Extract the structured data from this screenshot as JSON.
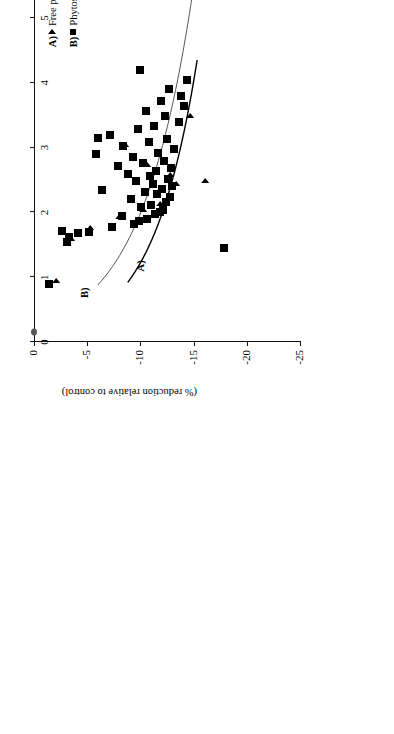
{
  "chart_data": {
    "type": "scatter",
    "title": "",
    "xlabel": "(g sterol equivalents/d)",
    "ylabel": "(% reduction relative to control)",
    "xlim": [
      0,
      10
    ],
    "ylim": [
      -25,
      0
    ],
    "xticks": [
      "0",
      "1",
      "2",
      "3",
      "4",
      "5",
      "6",
      "7",
      "8",
      "9",
      "10"
    ],
    "yticks": [
      "0",
      "-5",
      "-10",
      "-15",
      "-20",
      "-25"
    ],
    "grid": false,
    "legend_position": "upper-right",
    "orientation_note": "page-rotated-90",
    "series": [
      {
        "name": "Free phytosterols/stanols",
        "key": "A)",
        "marker": "triangle",
        "color": "#000000",
        "fit_label": "y = -4.2001Ln(x) - 9.1568",
        "fit_coef": -4.2001,
        "fit_const": -9.1568,
        "points": [
          [
            0.95,
            -2.2
          ],
          [
            1.6,
            -3.6
          ],
          [
            1.78,
            -5.4
          ],
          [
            1.95,
            -8.1
          ],
          [
            2.05,
            -10.3
          ],
          [
            2.15,
            -11.9
          ],
          [
            2.22,
            -12.6
          ],
          [
            2.45,
            -13.4
          ],
          [
            2.6,
            -12.9
          ],
          [
            2.75,
            -10.7
          ],
          [
            3.05,
            -8.6
          ],
          [
            2.5,
            -16.2
          ],
          [
            3.5,
            -14.8
          ]
        ]
      },
      {
        "name": "Phytosterol/stanol esters",
        "key": "B)",
        "marker": "square",
        "color": "#000000",
        "fit_label": "y = -4.92Ln(x) - 6.625",
        "fit_coef": -4.92,
        "fit_const": -6.625,
        "points": [
          [
            0.9,
            -1.4
          ],
          [
            1.55,
            -3.1
          ],
          [
            1.62,
            -3.3
          ],
          [
            1.7,
            -5.2
          ],
          [
            1.72,
            -2.6
          ],
          [
            1.78,
            -7.3
          ],
          [
            1.82,
            -9.4
          ],
          [
            1.86,
            -9.9
          ],
          [
            1.9,
            -10.6
          ],
          [
            1.94,
            -8.3
          ],
          [
            1.98,
            -11.4
          ],
          [
            2.0,
            -11.8
          ],
          [
            2.04,
            -12.1
          ],
          [
            2.08,
            -10.1
          ],
          [
            2.12,
            -11.0
          ],
          [
            2.16,
            -12.4
          ],
          [
            2.2,
            -9.1
          ],
          [
            2.24,
            -12.8
          ],
          [
            2.28,
            -11.6
          ],
          [
            2.32,
            -10.4
          ],
          [
            2.36,
            -12.0
          ],
          [
            2.4,
            -13.0
          ],
          [
            2.44,
            -11.2
          ],
          [
            2.48,
            -9.6
          ],
          [
            2.52,
            -12.6
          ],
          [
            2.56,
            -10.9
          ],
          [
            2.6,
            -8.8
          ],
          [
            2.64,
            -11.5
          ],
          [
            2.68,
            -12.9
          ],
          [
            2.72,
            -7.9
          ],
          [
            2.76,
            -10.2
          ],
          [
            2.8,
            -12.2
          ],
          [
            2.86,
            -9.3
          ],
          [
            2.92,
            -11.7
          ],
          [
            2.98,
            -13.2
          ],
          [
            3.02,
            -8.4
          ],
          [
            3.08,
            -10.8
          ],
          [
            3.14,
            -12.5
          ],
          [
            3.2,
            -7.1
          ],
          [
            3.28,
            -9.8
          ],
          [
            3.34,
            -11.3
          ],
          [
            3.4,
            -13.6
          ],
          [
            3.48,
            -12.3
          ],
          [
            3.56,
            -10.5
          ],
          [
            3.64,
            -14.1
          ],
          [
            3.72,
            -11.9
          ],
          [
            3.8,
            -13.8
          ],
          [
            3.9,
            -12.7
          ],
          [
            4.05,
            -14.4
          ],
          [
            4.2,
            -10.0
          ],
          [
            2.35,
            -6.4
          ],
          [
            2.9,
            -5.8
          ],
          [
            3.15,
            -6.0
          ],
          [
            1.68,
            -4.1
          ],
          [
            8.6,
            -22.1
          ],
          [
            1.45,
            -17.9
          ]
        ]
      }
    ],
    "origin_marker": {
      "x": 0.15,
      "y": 0.0
    }
  },
  "legend": {
    "rows": [
      {
        "key": "A)",
        "marker": "triangle",
        "text": "Free phytosterols/stanols: y = -4.2001Ln(x) - 9.1568"
      },
      {
        "key": "B)",
        "marker": "square",
        "text": "Phytosterol/stanol esters: y = -4.92Ln(x) - 6.625"
      }
    ]
  },
  "curve_labels": {
    "a": "A)",
    "b": "B)"
  }
}
